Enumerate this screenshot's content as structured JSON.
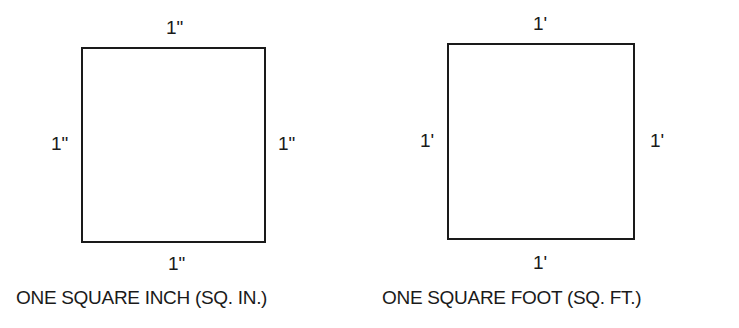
{
  "figures": [
    {
      "id": "square-inch",
      "side_labels": {
        "top": "1\"",
        "left": "1\"",
        "right": "1\"",
        "bottom": "1\""
      },
      "caption": "ONE SQUARE INCH (SQ. IN.)"
    },
    {
      "id": "square-foot",
      "side_labels": {
        "top": "1'",
        "left": "1'",
        "right": "1'",
        "bottom": "1'"
      },
      "caption": "ONE SQUARE FOOT (SQ. FT.)"
    }
  ],
  "colors": {
    "line": "#1a1a1a",
    "background": "#ffffff"
  }
}
